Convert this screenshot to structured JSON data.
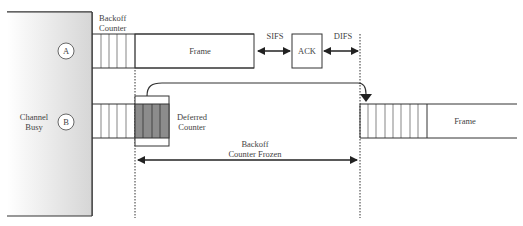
{
  "diagram": {
    "channel_busy": "Channel\nBusy",
    "channel_busy_line1": "Channel",
    "channel_busy_line2": "Busy",
    "station_a": "A",
    "station_b": "B",
    "backoff_counter_line1": "Backoff",
    "backoff_counter_line2": "Counter",
    "frame_a": "Frame",
    "sifs": "SIFS",
    "ack": "ACK",
    "difs": "DIFS",
    "deferred_counter_line1": "Deferred",
    "deferred_counter_line2": "Counter",
    "backoff_frozen_line1": "Backoff",
    "backoff_frozen_line2": "Counter Frozen",
    "frame_b": "Frame"
  },
  "colors": {
    "busy_gradient_start": "#ffffff",
    "busy_gradient_end": "#d9d9d9",
    "deferred_fill": "#8c8c8c",
    "line": "#333333"
  }
}
